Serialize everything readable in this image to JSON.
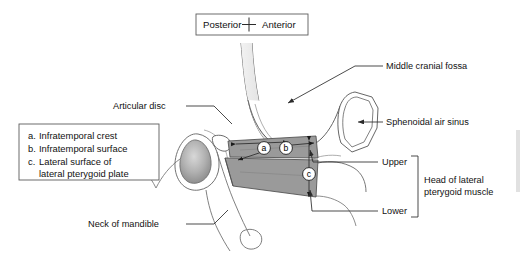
{
  "figure": {
    "kind": "anatomical-diagram",
    "background_color": "#ffffff",
    "muscle_fill_color": "#9a9a9a",
    "condyle_fill_color": "#b4b4b4",
    "outline_color": "#555555",
    "text_color": "#111111"
  },
  "orientation": {
    "posterior_label": "Posterior",
    "anterior_label": "Anterior",
    "marker": "plus-cross"
  },
  "legend": {
    "items": [
      {
        "key": "a.",
        "text": "Infratemporal crest"
      },
      {
        "key": "b.",
        "text": "Infratemporal surface"
      },
      {
        "key": "c.",
        "text": "Lateral surface of"
      },
      {
        "key": "",
        "text": "lateral pterygoid plate"
      }
    ]
  },
  "markers": [
    {
      "id": "a",
      "letter": "a"
    },
    {
      "id": "b",
      "letter": "b"
    },
    {
      "id": "c",
      "letter": "c"
    }
  ],
  "labels": {
    "articular_disc": "Articular disc",
    "neck_of_mandible": "Neck of mandible",
    "middle_cranial_fossa": "Middle cranial fossa",
    "sphenoidal_air_sinus": "Sphenoidal air sinus",
    "upper": "Upper",
    "lower": "Lower",
    "head_of_muscle_line1": "Head of lateral",
    "head_of_muscle_line2": "pterygoid muscle"
  }
}
